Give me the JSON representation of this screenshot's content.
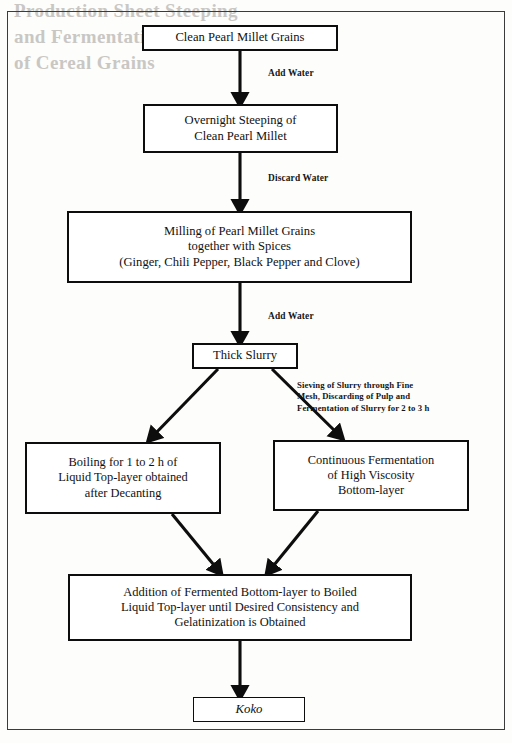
{
  "figure": {
    "frame": {
      "border_color": "#3b3b3b"
    },
    "box_border_color": "#0d0d0d",
    "background_color": "#fdfdfb",
    "arrow_color": "#0d0d0d"
  },
  "nodes": {
    "clean_grains": {
      "text": "Clean Pearl Millet  Grains"
    },
    "steeping": {
      "line1": "Overnight Steeping of",
      "line2": "Clean Pearl Millet"
    },
    "milling": {
      "line1": "Milling  of Pearl Millet  Grains",
      "line2": "together with Spices",
      "line3": "(Ginger,  Chili  Pepper, Black Pepper and Clove)"
    },
    "thick_slurry": {
      "text": "Thick Slurry"
    },
    "boiling": {
      "line1": "Boiling  for 1 to 2 h of",
      "line2": "Liquid Top-layer obtained",
      "line3": "after Decanting"
    },
    "fermentation": {
      "line1": "Continuous Fermentation",
      "line2": "of High  Viscosity",
      "line3": "Bottom-layer"
    },
    "addition": {
      "line1": "Addition of Fermented Bottom-layer to Boiled",
      "line2": "Liquid Top-layer until  Desired Consistency and",
      "line3": "Gelatinization  is Obtained"
    },
    "koko": {
      "text": "Koko"
    }
  },
  "edge_labels": {
    "add_water_1": "Add Water",
    "discard_water": "Discard Water",
    "add_water_2": "Add Water",
    "sieving": {
      "line1": "Sieving of Slurry through Fine",
      "line2": "Mesh, Discarding of Pulp and",
      "line3": "Fermentation of Slurry for 2 to 3 h"
    }
  },
  "bleed_through": {
    "line1": "Production Sheet Steeping",
    "line2": "and Fermentation",
    "line3": "of Cereal Grains"
  }
}
